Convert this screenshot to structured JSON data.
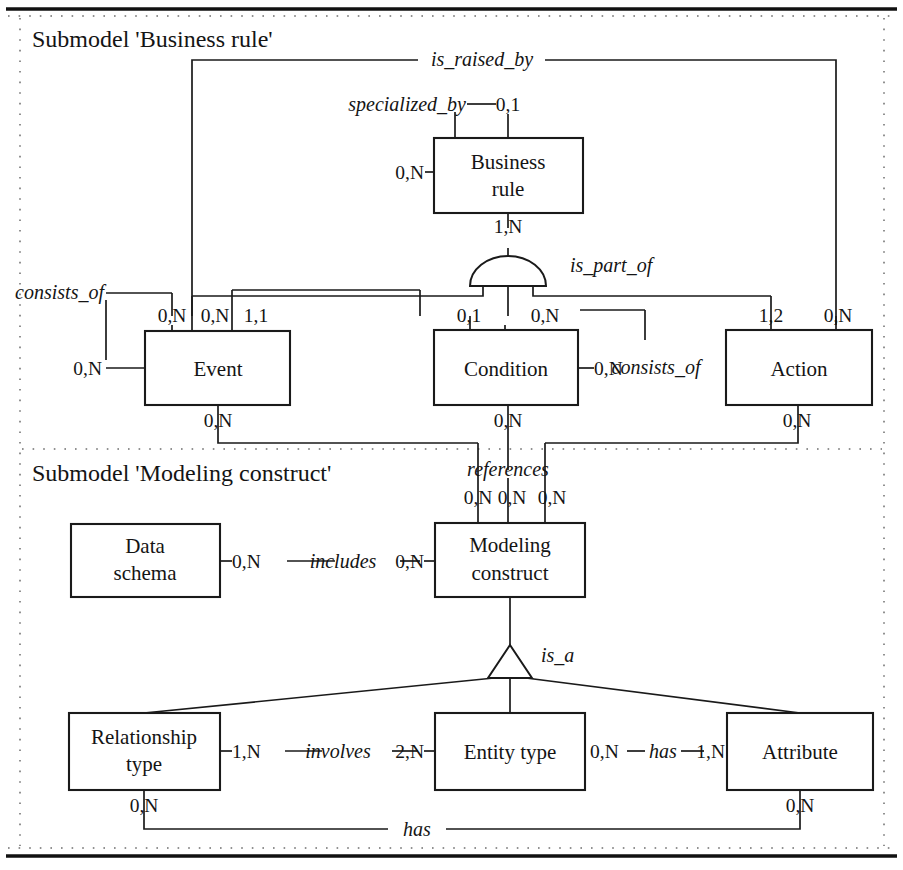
{
  "figure": {
    "type": "er-diagram",
    "notation": "Entity-Relationship with min,max cardinalities",
    "caption": "",
    "submodels": [
      {
        "id": "business-rule",
        "title": "Submodel 'Business rule'"
      },
      {
        "id": "modeling-construct",
        "title": "Submodel 'Modeling construct'"
      }
    ],
    "entities": [
      {
        "id": "business-rule",
        "label_line1": "Business",
        "label_line2": "rule"
      },
      {
        "id": "event",
        "label_line1": "Event",
        "label_line2": ""
      },
      {
        "id": "condition",
        "label_line1": "Condition",
        "label_line2": ""
      },
      {
        "id": "action",
        "label_line1": "Action",
        "label_line2": ""
      },
      {
        "id": "data-schema",
        "label_line1": "Data",
        "label_line2": "schema"
      },
      {
        "id": "modeling-construct",
        "label_line1": "Modeling",
        "label_line2": "construct"
      },
      {
        "id": "relationship-type",
        "label_line1": "Relationship",
        "label_line2": "type"
      },
      {
        "id": "entity-type",
        "label_line1": "Entity type",
        "label_line2": ""
      },
      {
        "id": "attribute",
        "label_line1": "Attribute",
        "label_line2": ""
      }
    ],
    "relationships": [
      {
        "id": "is-raised-by",
        "name": "is_raised_by"
      },
      {
        "id": "specialized-by",
        "name": "specialized_by"
      },
      {
        "id": "is-part-of",
        "name": "is_part_of"
      },
      {
        "id": "consists-of-event",
        "name": "consists_of"
      },
      {
        "id": "consists-of-cond",
        "name": "consists_of"
      },
      {
        "id": "references",
        "name": "references"
      },
      {
        "id": "includes",
        "name": "includes"
      },
      {
        "id": "is-a",
        "name": "is_a"
      },
      {
        "id": "involves",
        "name": "involves"
      },
      {
        "id": "has-entity-attr",
        "name": "has"
      },
      {
        "id": "has-reltype-attr",
        "name": "has"
      }
    ],
    "cardinalities": {
      "is_raised_by_br": "0,1",
      "specialized_by_left": "0,N",
      "is_part_of_br": "1,N",
      "consists_of_event_left": "0,N",
      "consists_of_event_top": "0,N",
      "event_top_mid": "0,N",
      "event_top_right": "1,1",
      "event_bottom": "0,N",
      "condition_top_left": "0,1",
      "condition_top_right": "0,N",
      "consists_of_cond_right": "0,N",
      "condition_bottom": "0,N",
      "action_top_left": "1,2",
      "action_top_right": "0,N",
      "action_bottom": "0,N",
      "references_mc_left": "0,N",
      "references_mc_mid": "0,N",
      "references_mc_right": "0,N",
      "includes_left": "0,N",
      "includes_right": "0,N",
      "involves_left": "1,N",
      "involves_right": "2,N",
      "has_entity_left": "0,N",
      "has_attr_right": "1,N",
      "has_reltype_bottom": "0,N",
      "has_attr_bottom": "0,N"
    },
    "colors": {
      "ink": "#1a1a1a",
      "paper": "#ffffff",
      "frame": "#6d6d6d"
    }
  }
}
